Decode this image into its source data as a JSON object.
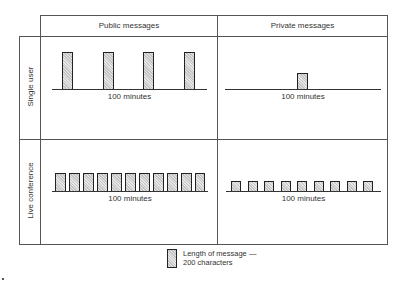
{
  "diagram": {
    "columns": [
      {
        "id": "public",
        "label": "Public messages"
      },
      {
        "id": "private",
        "label": "Private messages"
      }
    ],
    "rows": [
      {
        "id": "single",
        "label": "Single user"
      },
      {
        "id": "live",
        "label": "Live conference"
      }
    ],
    "cells": {
      "single_public": {
        "timeline_label": "100 minutes",
        "bar_count": 4,
        "bar_size": "tall"
      },
      "single_private": {
        "timeline_label": "100 minutes",
        "bar_count": 1,
        "bar_size": "short"
      },
      "live_public": {
        "timeline_label": "100 minutes",
        "bar_count": 11,
        "bar_size": "medium"
      },
      "live_private": {
        "timeline_label": "100 minutes",
        "bar_count": 9,
        "bar_size": "small"
      }
    },
    "legend": {
      "line1": "Length of message —",
      "line2": "200 characters"
    },
    "colors": {
      "grid_line": "#555555",
      "bar_border": "#222222",
      "bar_fill": "#d8d8d8"
    }
  }
}
